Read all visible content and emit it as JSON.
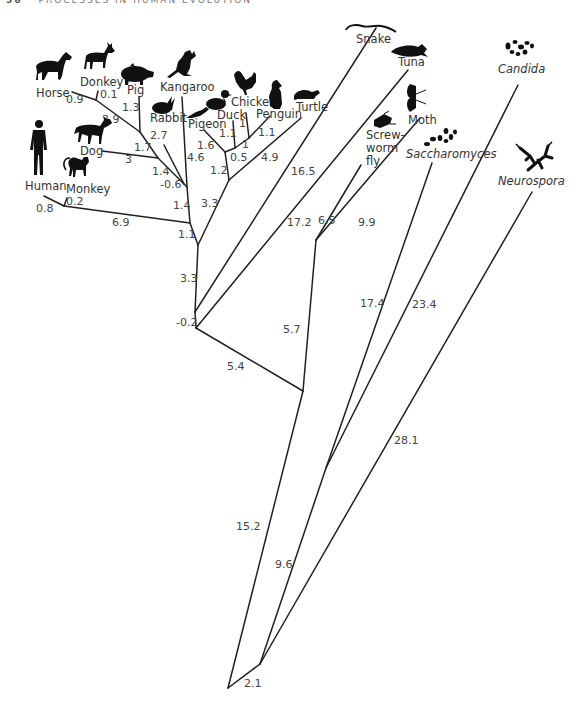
{
  "header": {
    "page_number": "56",
    "running_title": "PROCESSES IN HUMAN EVOLUTION"
  },
  "figure": {
    "type": "phylogenetic-tree",
    "taxa": [
      {
        "id": "horse",
        "label": "Horse",
        "italic": false,
        "icon": "horse-icon"
      },
      {
        "id": "donkey",
        "label": "Donkey",
        "italic": false,
        "icon": "donkey-icon"
      },
      {
        "id": "pig",
        "label": "Pig",
        "italic": false,
        "icon": "pig-icon"
      },
      {
        "id": "kangaroo",
        "label": "Kangaroo",
        "italic": false,
        "icon": "kangaroo-icon"
      },
      {
        "id": "rabbit",
        "label": "Rabbit",
        "italic": false,
        "icon": "rabbit-icon"
      },
      {
        "id": "dog",
        "label": "Dog",
        "italic": false,
        "icon": "dog-icon"
      },
      {
        "id": "human",
        "label": "Human",
        "italic": false,
        "icon": "human-icon"
      },
      {
        "id": "monkey",
        "label": "Monkey",
        "italic": false,
        "icon": "monkey-icon"
      },
      {
        "id": "pigeon",
        "label": "Pigeon",
        "italic": false,
        "icon": "pigeon-icon"
      },
      {
        "id": "duck",
        "label": "Duck",
        "italic": false,
        "icon": "duck-icon"
      },
      {
        "id": "chicken",
        "label": "Chicken",
        "italic": false,
        "icon": "chicken-icon"
      },
      {
        "id": "penguin",
        "label": "Penguin",
        "italic": false,
        "icon": "penguin-icon"
      },
      {
        "id": "turtle",
        "label": "Turtle",
        "italic": false,
        "icon": "turtle-icon"
      },
      {
        "id": "snake",
        "label": "Snake",
        "italic": false,
        "icon": "snake-icon"
      },
      {
        "id": "tuna",
        "label": "Tuna",
        "italic": false,
        "icon": "fish-icon"
      },
      {
        "id": "screwworm",
        "label_lines": [
          "Screw-",
          "worm",
          "fly"
        ],
        "italic": false,
        "icon": "fly-icon"
      },
      {
        "id": "moth",
        "label": "Moth",
        "italic": false,
        "icon": "moth-icon"
      },
      {
        "id": "saccharomyces",
        "label": "Saccharomyces",
        "italic": true,
        "icon": "yeast-icon"
      },
      {
        "id": "candida",
        "label": "Candida",
        "italic": true,
        "icon": "candida-icon"
      },
      {
        "id": "neurospora",
        "label": "Neurospora",
        "italic": true,
        "icon": "fungus-icon"
      }
    ],
    "branch_lengths": {
      "horse": "0.9",
      "donkey": "0.1",
      "pig": "1.3",
      "horse_donkey_pig_stem": "2.9",
      "ungulate_dog_stem": "1.7",
      "dog": "3",
      "carnivore_ungulate_stem": "1.4",
      "rabbit": "2.7",
      "placental_stem": "-0.6",
      "kangaroo": "4.6",
      "mammal_stem": "1.4",
      "human": "0.8",
      "monkey": "0.2",
      "primate_stem": "6.9",
      "mammal_primate_join": "1.1",
      "pigeon": "1.6",
      "duck": "1.1",
      "chicken": "1",
      "penguin": "1.1",
      "chicken_penguin_stem": "1",
      "bird_stem": "0.5",
      "turtle": "4.9",
      "bird_turtle_stem": "1.2",
      "reptile_stem": "3.3",
      "amniote_stem": "3.3",
      "snake": "16.5",
      "tuna": "17.2",
      "vertebrate_stem": "-0.2",
      "screwworm_fly": "6.5",
      "moth": "9.9",
      "insect_stem": "5.7",
      "animal_stem": "5.4",
      "saccharomyces": "17.4",
      "candida": "23.4",
      "yeast_stem": "9.6",
      "neurospora": "28.1",
      "animal_root_stem": "15.2",
      "fungi_root_stem": "2.1"
    }
  }
}
